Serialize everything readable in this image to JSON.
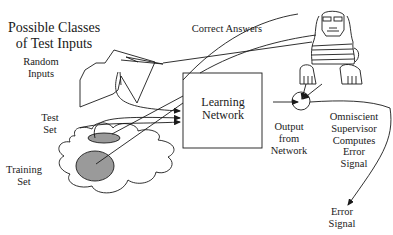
{
  "diagram": {
    "title": "Possible Classes\nof Test Inputs",
    "labels": {
      "random_inputs": "Random\nInputs",
      "test_set": "Test\nSet",
      "training_set": "Training\nSet",
      "correct_answers": "Correct Answers",
      "learning_network": "Learning\nNetwork",
      "output_from_network": "Output\nfrom\nNetwork",
      "supervisor": "Omniscient\nSupervisor\nComputes\nError\nSignal",
      "error_signal": "Error\nSignal"
    },
    "colors": {
      "line": "#1a1a1a",
      "ellipse_fill": "#9a9a9a",
      "background": "#ffffff"
    }
  }
}
